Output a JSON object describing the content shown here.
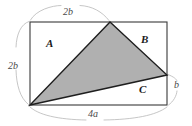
{
  "figure": {
    "type": "geometry-diagram",
    "colors": {
      "background": "#ffffff",
      "outline": "#3a3a3a",
      "triangle_fill": "#b0b0b0",
      "triangle_stroke": "#1e1e1e",
      "dimension_arc": "#b5b5b5",
      "label_text": "#1b1b1b",
      "dimension_text": "#4a4a4a"
    },
    "rectangle": {
      "x": 30,
      "y": 22,
      "width": 137,
      "height": 83
    },
    "triangle": {
      "vertices": [
        {
          "name": "apex-top",
          "x": 110,
          "y": 22
        },
        {
          "name": "vertex-right",
          "x": 167,
          "y": 75
        },
        {
          "name": "vertex-bottom-left",
          "x": 30,
          "y": 105
        }
      ]
    },
    "region_labels": [
      {
        "id": "A",
        "text": "A",
        "position": "top-left"
      },
      {
        "id": "B",
        "text": "B",
        "position": "top-right"
      },
      {
        "id": "C",
        "text": "C",
        "position": "bottom-right"
      }
    ],
    "dimensions": [
      {
        "id": "top",
        "text": "2b",
        "side": "top",
        "measures": "distance from top-left corner to triangle apex"
      },
      {
        "id": "left",
        "text": "2b",
        "side": "left",
        "measures": "full height of rectangle"
      },
      {
        "id": "bottom",
        "text": "4a",
        "side": "bottom",
        "measures": "full width of rectangle"
      },
      {
        "id": "right",
        "text": "b",
        "side": "right",
        "measures": "distance from triangle right vertex to bottom-right corner"
      }
    ]
  }
}
